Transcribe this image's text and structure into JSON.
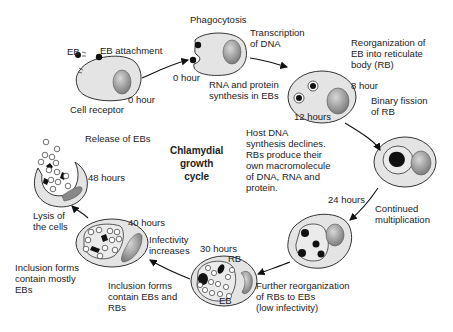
{
  "title": "Chlamydial\ngrowth\ncycle",
  "colors": {
    "cell_fill": "#e4e4e4",
    "nucleus": "#9a9a9a",
    "particle": "#111111",
    "stroke": "#333333"
  },
  "stages": [
    {
      "id": "attachment",
      "time": "0 hour",
      "labels": [
        "EB",
        "EB attachment",
        "Cell receptor"
      ]
    },
    {
      "id": "phagocytosis",
      "time": "0 hour",
      "labels": [
        "Phagocytosis",
        "RNA and protein\nsynthesis in EBs"
      ]
    },
    {
      "id": "reorganization",
      "time": "8 hour",
      "labels": [
        "Reorganization of\nEB into reticulate\nbody (RB)"
      ]
    },
    {
      "id": "binary-fission",
      "time": "12 hours",
      "labels": [
        "Binary fission\nof RB",
        "Host DNA\nsynthesis declines.\nRBs produce their\nown macromolecule\nof DNA, RNA and\nprotein."
      ]
    },
    {
      "id": "multiplication",
      "time": "24 hours",
      "labels": [
        "Continued\nmultiplication"
      ]
    },
    {
      "id": "further-reorganization",
      "time": "30 hours",
      "labels": [
        "RB",
        "EB",
        "Further reorganization\nof RBs to EBs\n(low infectivity)",
        "Inclusion forms\ncontain EBs and\nRBs"
      ]
    },
    {
      "id": "infectivity",
      "time": "40 hours",
      "labels": [
        "Infectivity\nincreases",
        "Inclusion forms\ncontain mostly\nEBs",
        "Lysis of\nthe cells"
      ]
    },
    {
      "id": "release",
      "time": "48 hours",
      "labels": [
        "Release of EBs"
      ]
    }
  ],
  "transcription": "Transcription\nof DNA"
}
